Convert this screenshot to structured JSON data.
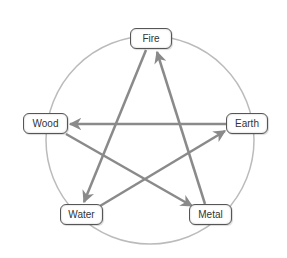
{
  "diagram": {
    "circle": {
      "cx": 150,
      "cy": 140,
      "r": 104,
      "color": "#bbbbbb"
    },
    "arrow_color": "#8a8a8a",
    "nodes": [
      {
        "id": "fire",
        "label": "Fire",
        "x": 130,
        "y": 28,
        "w": 42,
        "h": 22
      },
      {
        "id": "wood",
        "label": "Wood",
        "x": 23,
        "y": 113,
        "w": 45,
        "h": 22
      },
      {
        "id": "earth",
        "label": "Earth",
        "x": 226,
        "y": 113,
        "w": 42,
        "h": 22
      },
      {
        "id": "water",
        "label": "Water",
        "x": 60,
        "y": 204,
        "w": 43,
        "h": 22
      },
      {
        "id": "metal",
        "label": "Metal",
        "x": 189,
        "y": 204,
        "w": 43,
        "h": 22
      }
    ],
    "arrows": [
      {
        "from": "Metal",
        "to": "Fire"
      },
      {
        "from": "Fire",
        "to": "Water"
      },
      {
        "from": "Water",
        "to": "Earth"
      },
      {
        "from": "Earth",
        "to": "Wood"
      },
      {
        "from": "Wood",
        "to": "Metal"
      }
    ]
  }
}
